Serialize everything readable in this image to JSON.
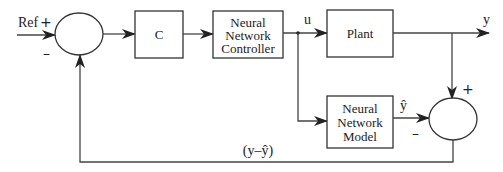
{
  "diagram": {
    "type": "block-diagram",
    "input": {
      "label": "Ref",
      "sign": "+"
    },
    "summing_junction_1": {
      "plus": "+",
      "minus": "–"
    },
    "blocks": {
      "controller_c": {
        "label": "C"
      },
      "nn_controller": {
        "line1": "Neural",
        "line2": "Network",
        "line3": "Controller"
      },
      "plant": {
        "label": "Plant"
      },
      "nn_model": {
        "line1": "Neural",
        "line2": "Network",
        "line3": "Model"
      }
    },
    "signals": {
      "u": "u",
      "y": "y",
      "y_hat": "ŷ",
      "error": "(y–ŷ)"
    },
    "summing_junction_2": {
      "plus": "+",
      "minus": "–"
    },
    "edges": [
      {
        "from": "Ref",
        "to": "summing_junction_1"
      },
      {
        "from": "summing_junction_1",
        "to": "C"
      },
      {
        "from": "C",
        "to": "Neural Network Controller"
      },
      {
        "from": "Neural Network Controller",
        "to": "Plant",
        "label": "u"
      },
      {
        "from": "u",
        "to": "Neural Network Model"
      },
      {
        "from": "Plant",
        "to": "output",
        "label": "y"
      },
      {
        "from": "y",
        "to": "summing_junction_2",
        "sign": "+"
      },
      {
        "from": "Neural Network Model",
        "to": "summing_junction_2",
        "label": "ŷ",
        "sign": "-"
      },
      {
        "from": "summing_junction_2",
        "to": "summing_junction_1",
        "label": "(y-ŷ)",
        "sign": "-"
      }
    ]
  }
}
